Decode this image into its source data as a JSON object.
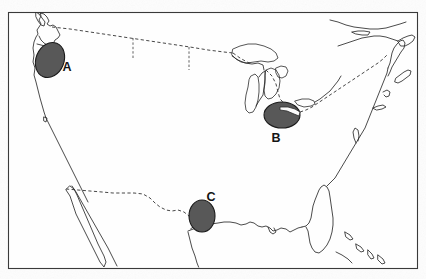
{
  "figure": {
    "type": "outline-map",
    "region": "Contiguous United States",
    "title": "",
    "background_color": "#fdfdfd",
    "frame": {
      "stroke_color": "#3a3a3a",
      "x": 8,
      "y": 12,
      "width": 409,
      "height": 256
    },
    "coastline_color": "#2b2b2b",
    "border_style": "dashed",
    "border_color": "#333333"
  },
  "markers": [
    {
      "label": "A",
      "shape": "ellipse",
      "fill_color": "#585858",
      "outline_color": "#1b1b1b",
      "center_x": 50,
      "center_y": 60,
      "radius_x": 14,
      "radius_y": 18,
      "rotation_deg": 22,
      "label_x": 67,
      "label_y": 71,
      "region_name": "Pacific Northwest",
      "clipped": false
    },
    {
      "label": "B",
      "shape": "ellipse",
      "fill_color": "#585858",
      "outline_color": "#1b1b1b",
      "center_x": 282,
      "center_y": 115,
      "radius_x": 18,
      "radius_y": 13,
      "rotation_deg": 0,
      "label_x": 276,
      "label_y": 142,
      "region_name": "Lake Erie",
      "clipped": true
    },
    {
      "label": "C",
      "shape": "ellipse",
      "fill_color": "#585858",
      "outline_color": "#1b1b1b",
      "center_x": 202,
      "center_y": 216,
      "radius_x": 13,
      "radius_y": 16,
      "rotation_deg": 0,
      "label_x": 211,
      "label_y": 201,
      "region_name": "Central Texas",
      "clipped": false
    }
  ],
  "legend": {
    "present": false,
    "items": []
  },
  "axes": {
    "present": false,
    "x_label": "",
    "y_label": ""
  },
  "chart_data": {
    "type": "map",
    "title": "",
    "xlabel": "",
    "ylabel": "",
    "categories": [
      "A",
      "B",
      "C"
    ],
    "values": [
      1,
      1,
      1
    ],
    "annotations": [
      {
        "label": "A",
        "location": "Pacific Northwest",
        "x": 50,
        "y": 60
      },
      {
        "label": "B",
        "location": "Lake Erie",
        "x": 282,
        "y": 115
      },
      {
        "label": "C",
        "location": "Central Texas",
        "x": 202,
        "y": 216
      }
    ],
    "grid": false,
    "legend_position": "none"
  }
}
